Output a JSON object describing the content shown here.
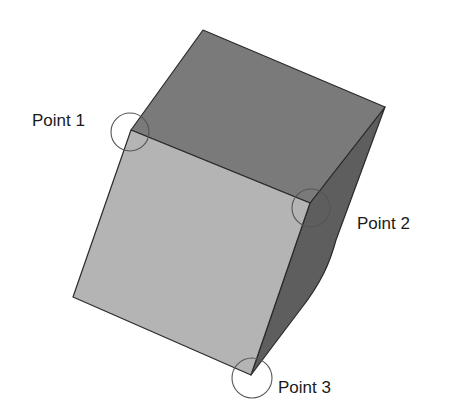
{
  "diagram": {
    "colors": {
      "background": "#ffffff",
      "top_face": "#7a7a7a",
      "front_face": "#b4b4b4",
      "right_face": "#5e5e5e",
      "edge": "#2a2a2a",
      "marker_circle": "#555555",
      "label_text": "#1a1a1a"
    },
    "points": [
      {
        "id": "point-1",
        "label": "Point 1"
      },
      {
        "id": "point-2",
        "label": "Point 2"
      },
      {
        "id": "point-3",
        "label": "Point 3"
      }
    ]
  }
}
